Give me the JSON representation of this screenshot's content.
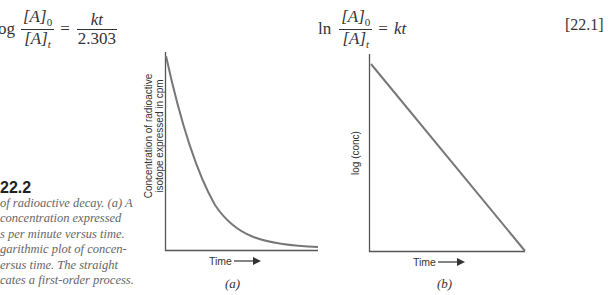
{
  "equations": {
    "left": {
      "prefix": "og",
      "lhs_num": "[A]0",
      "lhs_den": "[A]t",
      "equals": "=",
      "rhs_num": "kt",
      "rhs_den": "2.303"
    },
    "right": {
      "prefix": "ln",
      "lhs_num": "[A]0",
      "lhs_den": "[A]t",
      "equals": "=",
      "rhs": "kt",
      "number": "[22.1]"
    }
  },
  "figure": {
    "number": "22.2",
    "caption_lines": [
      "of radioactive decay. (a) A",
      " concentration expressed",
      "s per minute versus time.",
      "garithmic plot of concen-",
      "ersus time. The straight",
      "cates a first-order process."
    ]
  },
  "chart_data": [
    {
      "type": "line",
      "panel_label": "(a)",
      "title": "",
      "xlabel": "Time",
      "ylabel": "Concentration of radioactive isotope expressed in cpm",
      "ylabel_lines": [
        "Concentration of radioactive",
        "isotope expressed in cpm"
      ],
      "x_arrow": true,
      "grid": false,
      "ticks": false,
      "curve": "exponential decay",
      "x": [
        0,
        0.1,
        0.2,
        0.3,
        0.4,
        0.5,
        0.6,
        0.7,
        0.8,
        0.9,
        1.0
      ],
      "values": [
        1.0,
        0.6,
        0.37,
        0.22,
        0.14,
        0.08,
        0.05,
        0.03,
        0.02,
        0.015,
        0.012
      ],
      "xlim": [
        0,
        1
      ],
      "ylim": [
        0,
        1
      ]
    },
    {
      "type": "line",
      "panel_label": "(b)",
      "title": "",
      "xlabel": "Time",
      "ylabel": "log (conc)",
      "x_arrow": true,
      "grid": false,
      "ticks": false,
      "curve": "straight line (first-order)",
      "x": [
        0,
        1
      ],
      "values": [
        0.95,
        0
      ],
      "xlim": [
        0,
        1
      ],
      "ylim": [
        0,
        1
      ]
    }
  ],
  "colors": {
    "axis": "#555555",
    "curve": "#777777",
    "text": "#333333",
    "caption": "#666666"
  }
}
